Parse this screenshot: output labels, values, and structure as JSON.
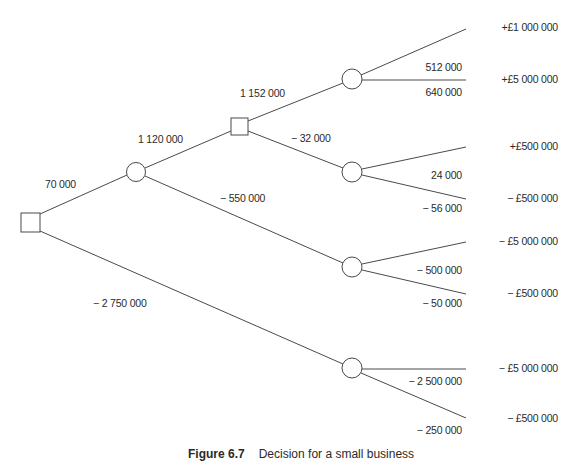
{
  "diagram": {
    "type": "decision-tree",
    "nodes": {
      "decision_1": {
        "shape": "square"
      },
      "chance_1": {
        "shape": "circle"
      },
      "decision_2": {
        "shape": "square"
      },
      "chance_2": {
        "shape": "circle"
      },
      "chance_3": {
        "shape": "circle"
      },
      "chance_4": {
        "shape": "circle"
      },
      "chance_5": {
        "shape": "circle"
      }
    },
    "branch_values": {
      "d1_to_c1": "70 000",
      "d1_to_c5": "− 2 750 000",
      "c1_to_d2": "1 120 000",
      "c1_to_c4": "− 550 000",
      "d2_to_c2": "1 152 000",
      "d2_to_c3": "− 32 000",
      "c2_upper": "512 000",
      "c2_lower": "640 000",
      "c3_upper": "24 000",
      "c3_lower": "− 56 000",
      "c4_upper": "− 500 000",
      "c4_lower": "− 50 000",
      "c5_upper": "− 2 500 000",
      "c5_lower": "− 250 000"
    },
    "outcomes": [
      "+£1 000 000",
      "+£5 000 000",
      "+£500 000",
      "− £500 000",
      "− £5 000 000",
      "− £500 000",
      "− £5 000 000",
      "− £500 000"
    ],
    "caption": {
      "number": "Figure 6.7",
      "title": "Decision for a small business"
    }
  }
}
